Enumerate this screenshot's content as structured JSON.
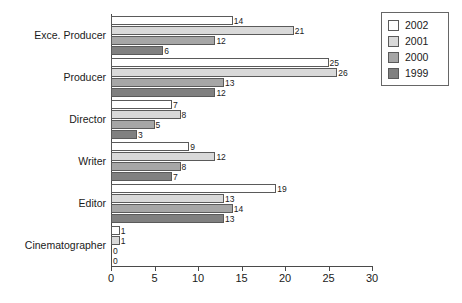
{
  "chart_data": {
    "type": "bar",
    "orientation": "horizontal",
    "title": "",
    "xlabel": "",
    "ylabel": "",
    "xlim": [
      0,
      30
    ],
    "xticks": [
      0,
      5,
      10,
      15,
      20,
      25,
      30
    ],
    "grid": false,
    "legend_position": "top-right",
    "categories": [
      "Exce. Producer",
      "Producer",
      "Director",
      "Writer",
      "Editor",
      "Cinematographer"
    ],
    "series": [
      {
        "name": "2002",
        "color": "#ffffff",
        "values": [
          14,
          25,
          7,
          9,
          19,
          1
        ]
      },
      {
        "name": "2001",
        "color": "#d9d9d9",
        "values": [
          21,
          26,
          8,
          12,
          13,
          1
        ]
      },
      {
        "name": "2000",
        "color": "#a6a6a6",
        "values": [
          12,
          13,
          5,
          8,
          14,
          0
        ]
      },
      {
        "name": "1999",
        "color": "#808080",
        "values": [
          6,
          12,
          3,
          7,
          13,
          0
        ]
      }
    ]
  },
  "legend": {
    "items": [
      {
        "label": "2002"
      },
      {
        "label": "2001"
      },
      {
        "label": "2000"
      },
      {
        "label": "1999"
      }
    ]
  },
  "axis": {
    "x_tick_labels": [
      "0",
      "5",
      "10",
      "15",
      "20",
      "25",
      "30"
    ]
  }
}
